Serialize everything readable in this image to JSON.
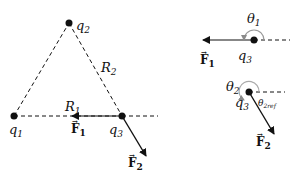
{
  "diagram": {
    "type": "coulomb-force-vector-diagram",
    "left_panel": {
      "charges": [
        {
          "id": "q1",
          "name": "q",
          "sub": "1"
        },
        {
          "id": "q2",
          "name": "q",
          "sub": "2"
        },
        {
          "id": "q3",
          "name": "q",
          "sub": "3"
        }
      ],
      "distances": [
        {
          "id": "R1",
          "name": "R",
          "sub": "1"
        },
        {
          "id": "R2",
          "name": "R",
          "sub": "2"
        }
      ],
      "forces": [
        {
          "id": "F1",
          "name": "F",
          "sub": "1",
          "arrow": "→"
        },
        {
          "id": "F2",
          "name": "F",
          "sub": "2",
          "arrow": "→"
        }
      ]
    },
    "right_panel": {
      "top": {
        "charge": {
          "name": "q",
          "sub": "3"
        },
        "force": {
          "name": "F",
          "sub": "1",
          "arrow": "→"
        },
        "angle": {
          "name": "θ",
          "sub": "1"
        }
      },
      "bottom": {
        "charge": {
          "name": "q",
          "sub": "3"
        },
        "force": {
          "name": "F",
          "sub": "2",
          "arrow": "→"
        },
        "angle": {
          "name": "θ",
          "sub": "2"
        },
        "ref_angle": {
          "name": "θ",
          "sub": "2ref"
        }
      }
    },
    "colors": {
      "ink": "#111111",
      "angle_arc": "#999999",
      "angle_arrow": "#8a8a8a"
    }
  }
}
